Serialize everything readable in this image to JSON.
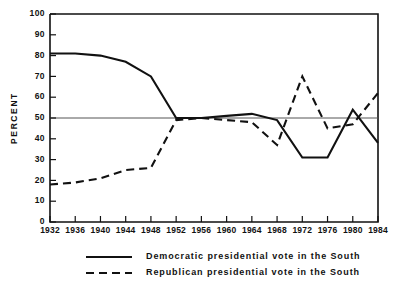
{
  "chart_data": {
    "type": "line",
    "title": "",
    "subtitle": "",
    "xlabel": "",
    "ylabel": "PERCENT",
    "x": [
      1932,
      1936,
      1940,
      1944,
      1948,
      1952,
      1956,
      1960,
      1964,
      1968,
      1972,
      1976,
      1980,
      1984
    ],
    "categories": [
      "1932",
      "1936",
      "1940",
      "1944",
      "1948",
      "1952",
      "1956",
      "1960",
      "1964",
      "1968",
      "1972",
      "1976",
      "1980",
      "1984"
    ],
    "xlim": [
      1932,
      1984
    ],
    "ylim": [
      0,
      100
    ],
    "ytick_labels": [
      "0",
      "10",
      "20",
      "30",
      "40",
      "50",
      "60",
      "70",
      "80",
      "90",
      "100"
    ],
    "ytick_values": [
      0,
      10,
      20,
      30,
      40,
      50,
      60,
      70,
      80,
      90,
      100
    ],
    "grid": false,
    "reference_lines": [
      {
        "name": "fifty-percent-line",
        "axis": "y",
        "value": 50
      }
    ],
    "legend_position": "below-plot",
    "series": [
      {
        "name": "Democratic presidential vote in the South",
        "style": "solid",
        "color": "#111111",
        "values": [
          81,
          81,
          80,
          77,
          70,
          50,
          50,
          51,
          52,
          49,
          31,
          31,
          54,
          38
        ]
      },
      {
        "name": "Republican presidential vote in the South",
        "style": "dashed",
        "color": "#111111",
        "values": [
          18,
          19,
          21,
          25,
          26,
          49,
          50,
          49,
          48,
          37,
          70,
          45,
          47,
          62
        ]
      }
    ]
  },
  "legend": {
    "items": [
      {
        "label": "Democratic presidential vote in the South",
        "style": "solid"
      },
      {
        "label": "Republican presidential vote in the South",
        "style": "dashed"
      }
    ]
  }
}
